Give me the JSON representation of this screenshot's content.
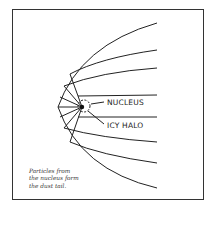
{
  "diagram": {
    "labels": {
      "nucleus": "NUCLEUS",
      "icy_halo": "ICY HALO"
    },
    "caption": [
      "Particles from",
      "the nucleus form",
      "the dust tail."
    ],
    "colors": {
      "line": "#222222",
      "background": "#ffffff",
      "frame": "#333333"
    }
  }
}
